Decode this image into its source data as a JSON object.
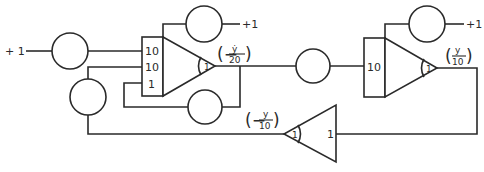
{
  "diagram": {
    "type": "analog computer circuit",
    "colors": {
      "line": "#2a2a2a",
      "background": "#ffffff"
    },
    "sources": [
      {
        "id": "src-left",
        "label": "+ 1"
      },
      {
        "id": "src-int1-top",
        "label": "+1"
      },
      {
        "id": "src-int2-top",
        "label": "+1"
      }
    ],
    "potentiometers": [
      {
        "id": "pot-input",
        "label": ""
      },
      {
        "id": "pot-feedback-left",
        "label": ""
      },
      {
        "id": "pot-int1-ic",
        "label": ""
      },
      {
        "id": "pot-int1-damping",
        "label": ""
      },
      {
        "id": "pot-middle",
        "label": ""
      },
      {
        "id": "pot-int2-ic",
        "label": ""
      }
    ],
    "integrator1": {
      "inputs": [
        "10",
        "10",
        "1"
      ],
      "gain": "1",
      "output": {
        "pre": "(−",
        "num": "ẏ",
        "den": "20",
        "post": ")"
      }
    },
    "integrator2": {
      "inputs": [
        "10"
      ],
      "gain": "1",
      "output": {
        "pre": "(",
        "num": "y",
        "den": "10",
        "post": ")"
      }
    },
    "inverter": {
      "input_gain": "1",
      "gain": "1",
      "output": {
        "pre": "(−",
        "num": "y",
        "den": "10",
        "post": ")"
      }
    }
  }
}
